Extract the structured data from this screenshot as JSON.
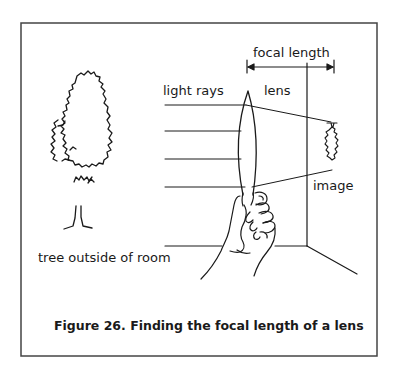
{
  "figure": {
    "caption": "Figure 26.  Finding the focal length of a lens",
    "labels": {
      "focal_length": "focal length",
      "light_rays": "light rays",
      "lens": "lens",
      "image": "image",
      "tree": "tree outside of room"
    },
    "elements": [
      "frame",
      "tree-illustration",
      "light-rays",
      "lens",
      "hand",
      "room-wall",
      "focal-length-dimension",
      "inverted-tree-image"
    ],
    "colors": {
      "ink": "#1a1a1a",
      "background": "#ffffff",
      "frame": "#444444"
    }
  }
}
